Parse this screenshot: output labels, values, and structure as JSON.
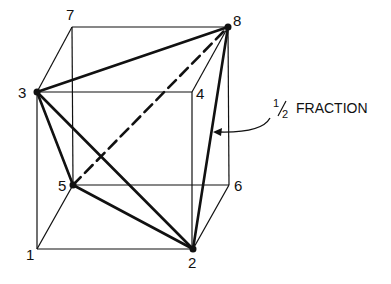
{
  "diagram": {
    "vertices": [
      {
        "id": "1",
        "label": "1",
        "x": 37,
        "y": 249,
        "in_fraction": false
      },
      {
        "id": "2",
        "label": "2",
        "x": 193,
        "y": 249,
        "in_fraction": true
      },
      {
        "id": "3",
        "label": "3",
        "x": 37,
        "y": 92,
        "in_fraction": true
      },
      {
        "id": "4",
        "label": "4",
        "x": 192,
        "y": 92,
        "in_fraction": false
      },
      {
        "id": "5",
        "label": "5",
        "x": 73,
        "y": 185,
        "in_fraction": true
      },
      {
        "id": "6",
        "label": "6",
        "x": 229,
        "y": 185,
        "in_fraction": false
      },
      {
        "id": "7",
        "label": "7",
        "x": 72,
        "y": 27,
        "in_fraction": false
      },
      {
        "id": "8",
        "label": "8",
        "x": 228,
        "y": 27,
        "in_fraction": true
      }
    ],
    "annotation": {
      "fraction_numerator": "1",
      "fraction_denominator": "2",
      "text": "FRACTION"
    }
  }
}
